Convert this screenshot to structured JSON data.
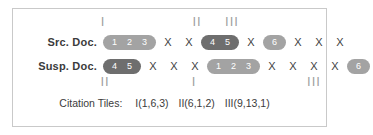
{
  "figure": {
    "ticks_top": [
      {
        "label": "I",
        "x": 90
      },
      {
        "label": "II",
        "x": 184
      },
      {
        "label": "III",
        "x": 219
      }
    ],
    "ticks_bottom": [
      {
        "label": "II",
        "x": 92
      },
      {
        "label": "I",
        "x": 181
      },
      {
        "label": "III",
        "x": 301
      }
    ],
    "rows": [
      {
        "label": "Src. Doc.",
        "items": [
          {
            "type": "pill",
            "shade": "light",
            "cells": [
              "1",
              "2",
              "3"
            ]
          },
          {
            "type": "x",
            "text": "X"
          },
          {
            "type": "x",
            "text": "X"
          },
          {
            "type": "pill",
            "shade": "dark",
            "cells": [
              "4",
              "5"
            ]
          },
          {
            "type": "x",
            "text": "X"
          },
          {
            "type": "pill",
            "shade": "light",
            "cells": [
              "6"
            ]
          },
          {
            "type": "x",
            "text": "X"
          },
          {
            "type": "x",
            "text": "X"
          },
          {
            "type": "x",
            "text": "X"
          }
        ]
      },
      {
        "label": "Susp. Doc.",
        "items": [
          {
            "type": "pill",
            "shade": "dark",
            "cells": [
              "4",
              "5"
            ]
          },
          {
            "type": "x",
            "text": "X"
          },
          {
            "type": "x",
            "text": "X"
          },
          {
            "type": "x",
            "text": "X"
          },
          {
            "type": "pill",
            "shade": "light",
            "cells": [
              "1",
              "2",
              "3"
            ]
          },
          {
            "type": "x",
            "text": "X"
          },
          {
            "type": "x",
            "text": "X"
          },
          {
            "type": "x",
            "text": "X"
          },
          {
            "type": "x",
            "text": "X"
          },
          {
            "type": "pill",
            "shade": "light",
            "cells": [
              "6"
            ]
          }
        ]
      }
    ],
    "caption": {
      "label": "Citation Tiles:",
      "tiles": [
        "I(1,6,3)",
        "II(6,1,2)",
        "III(9,13,1)"
      ]
    },
    "colors": {
      "pill_light": "#a3a3a3",
      "pill_dark": "#6e6e6e",
      "tick": "#9f9f9f",
      "text": "#3b3b3b",
      "border": "#c9c9c9"
    }
  }
}
